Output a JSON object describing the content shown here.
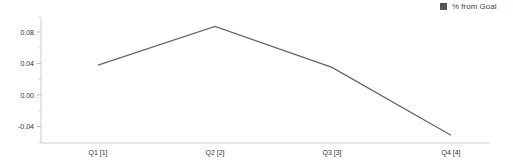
{
  "chart_data": {
    "type": "line",
    "title": "",
    "xlabel": "",
    "ylabel": "",
    "categories": [
      "Q1 [1]",
      "Q2 [2]",
      "Q3 [3]",
      "Q4 [4]"
    ],
    "series": [
      {
        "name": "% from Goal",
        "values": [
          0.038,
          0.087,
          0.035,
          -0.051
        ],
        "color": "#666666"
      }
    ],
    "yticks": [
      0.08,
      0.04,
      0.0,
      -0.04
    ],
    "ytick_labels": [
      "0.08",
      "0.04",
      "0.00",
      "-0.04"
    ],
    "ylim": [
      -0.06,
      0.1
    ],
    "grid": false,
    "legend_position": "top-right"
  },
  "legend": {
    "label": "% from Goal",
    "swatch_color": "#555555"
  }
}
